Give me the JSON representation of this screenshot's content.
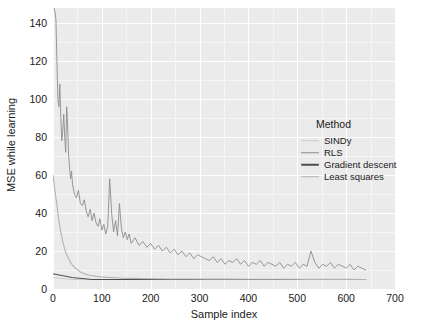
{
  "chart_data": {
    "type": "line",
    "title": "",
    "xlabel": "Sample index",
    "ylabel": "MSE while learning",
    "xlim": [
      0,
      700
    ],
    "ylim": [
      0,
      148
    ],
    "xticks": [
      0,
      100,
      200,
      300,
      400,
      500,
      600,
      700
    ],
    "yticks": [
      0,
      20,
      40,
      60,
      80,
      100,
      120,
      140
    ],
    "grid": true,
    "legend": {
      "title": "Method",
      "position": "right-inside",
      "entries": [
        "SINDy",
        "RLS",
        "Gradient descent",
        "Least squares"
      ]
    },
    "series": [
      {
        "name": "SINDy",
        "color": "#c9c9c9",
        "note": "flat near zero, hidden beneath other series",
        "x": [
          0,
          40,
          80,
          160,
          240,
          320,
          400,
          480,
          560,
          640
        ],
        "values": [
          6,
          5,
          5,
          5,
          5,
          5,
          5,
          5,
          5,
          5
        ]
      },
      {
        "name": "RLS",
        "color": "#8c8c8c",
        "note": "noisy decaying curve, large early transient above 148",
        "x": [
          2,
          4,
          6,
          8,
          10,
          12,
          14,
          16,
          18,
          20,
          22,
          24,
          26,
          28,
          30,
          32,
          34,
          36,
          38,
          40,
          44,
          48,
          52,
          56,
          60,
          64,
          68,
          72,
          76,
          80,
          84,
          88,
          92,
          96,
          100,
          104,
          108,
          112,
          116,
          120,
          124,
          128,
          132,
          136,
          140,
          144,
          148,
          152,
          156,
          160,
          168,
          176,
          184,
          192,
          200,
          208,
          216,
          224,
          232,
          240,
          248,
          256,
          264,
          272,
          280,
          288,
          296,
          304,
          312,
          320,
          328,
          336,
          344,
          352,
          360,
          368,
          376,
          384,
          392,
          400,
          408,
          416,
          424,
          432,
          440,
          448,
          456,
          464,
          472,
          480,
          488,
          496,
          504,
          512,
          520,
          528,
          536,
          544,
          552,
          560,
          568,
          576,
          584,
          592,
          600,
          608,
          616,
          624,
          632,
          640
        ],
        "values": [
          148,
          146,
          142,
          120,
          100,
          96,
          108,
          90,
          78,
          84,
          92,
          80,
          72,
          96,
          86,
          70,
          64,
          58,
          62,
          55,
          50,
          48,
          52,
          45,
          44,
          47,
          41,
          38,
          42,
          36,
          40,
          35,
          33,
          37,
          31,
          34,
          29,
          33,
          58,
          40,
          30,
          36,
          28,
          45,
          32,
          27,
          30,
          26,
          29,
          24,
          27,
          23,
          25,
          22,
          24,
          21,
          23,
          20,
          22,
          19,
          21,
          18,
          20,
          17,
          19,
          16,
          18,
          17,
          16,
          15,
          17,
          14,
          16,
          13,
          15,
          14,
          16,
          13,
          15,
          12,
          14,
          13,
          15,
          12,
          14,
          13,
          12,
          14,
          11,
          13,
          12,
          14,
          11,
          13,
          12,
          20,
          14,
          11,
          13,
          12,
          14,
          11,
          13,
          12,
          11,
          13,
          10,
          12,
          11,
          10
        ]
      },
      {
        "name": "Gradient descent",
        "color": "#4d4d4d",
        "note": "dark key in legend; trace overlaps near-zero region",
        "x": [
          0,
          40,
          80,
          160,
          240,
          320,
          400,
          480,
          560,
          640
        ],
        "values": [
          8,
          6,
          5,
          5,
          5,
          5,
          5,
          5,
          5,
          5
        ]
      },
      {
        "name": "Least squares",
        "color": "#b3b3b3",
        "note": "smooth exponential decay to steady state ~5",
        "x": [
          0,
          4,
          8,
          12,
          16,
          20,
          24,
          28,
          32,
          36,
          40,
          48,
          56,
          64,
          72,
          80,
          96,
          112,
          128,
          144,
          160,
          200,
          240,
          280,
          320,
          360,
          400,
          440,
          480,
          520,
          560,
          600,
          640
        ],
        "values": [
          60,
          52,
          44,
          36,
          30,
          25,
          21,
          18,
          16,
          14,
          12.5,
          10.5,
          9,
          8,
          7.4,
          7,
          6.4,
          6.1,
          5.9,
          5.7,
          5.6,
          5.4,
          5.3,
          5.25,
          5.2,
          5.18,
          5.15,
          5.12,
          5.1,
          5.08,
          5.06,
          5.05,
          5.04
        ]
      }
    ]
  },
  "theme": {
    "panel_bg": "#ebebeb",
    "grid_major": "#ffffff",
    "grid_minor": "#f6f6f6",
    "text": "#1a1a1a",
    "figure_bg": "#ffffff"
  }
}
